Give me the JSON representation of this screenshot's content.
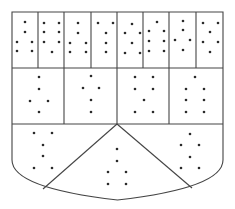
{
  "diagram": {
    "type": "shield-partition",
    "stroke_color": "#444444",
    "dot_color": "#2a2a2a",
    "background": "#ffffff",
    "outline": {
      "left": 12,
      "top": 12,
      "right": 223,
      "side_bottom": 160,
      "curve_bottom": 200
    },
    "row_dividers_y": [
      68,
      124
    ],
    "top_row_column_x": [
      38,
      64,
      91,
      117,
      143,
      169,
      196
    ],
    "middle_row_column_x": [
      64,
      117,
      169
    ],
    "bottom_apex": [
      117,
      124
    ],
    "bottom_diagonals": [
      [
        117,
        124,
        43,
        189
      ],
      [
        117,
        124,
        192,
        188
      ]
    ],
    "sections": [
      {
        "name": "top-1",
        "dots": [
          [
            25,
            22
          ],
          [
            25,
            32
          ],
          [
            17,
            42
          ],
          [
            32,
            42
          ],
          [
            17,
            51
          ],
          [
            32,
            51
          ]
        ]
      },
      {
        "name": "top-2",
        "dots": [
          [
            44,
            23
          ],
          [
            59,
            23
          ],
          [
            44,
            32
          ],
          [
            59,
            32
          ],
          [
            44,
            42
          ],
          [
            59,
            42
          ],
          [
            52,
            52
          ]
        ]
      },
      {
        "name": "top-3",
        "dots": [
          [
            78,
            23
          ],
          [
            78,
            33
          ],
          [
            70,
            43
          ],
          [
            86,
            43
          ],
          [
            70,
            52
          ],
          [
            86,
            52
          ]
        ]
      },
      {
        "name": "top-4",
        "dots": [
          [
            98,
            23
          ],
          [
            113,
            23
          ],
          [
            106,
            33
          ],
          [
            106,
            43
          ],
          [
            106,
            52
          ]
        ]
      },
      {
        "name": "top-5",
        "dots": [
          [
            132,
            24
          ],
          [
            125,
            33
          ],
          [
            140,
            33
          ],
          [
            132,
            43
          ],
          [
            125,
            53
          ],
          [
            140,
            53
          ]
        ]
      },
      {
        "name": "top-6",
        "dots": [
          [
            157,
            22
          ],
          [
            149,
            31
          ],
          [
            164,
            31
          ],
          [
            149,
            41
          ],
          [
            164,
            41
          ],
          [
            149,
            51
          ],
          [
            164,
            51
          ]
        ]
      },
      {
        "name": "top-7",
        "dots": [
          [
            183,
            21
          ],
          [
            175,
            40
          ],
          [
            190,
            40
          ],
          [
            183,
            30
          ],
          [
            183,
            50
          ]
        ]
      },
      {
        "name": "top-8",
        "dots": [
          [
            203,
            23
          ],
          [
            218,
            23
          ],
          [
            210,
            32
          ],
          [
            203,
            42
          ],
          [
            218,
            42
          ],
          [
            210,
            52
          ]
        ]
      },
      {
        "name": "middle-1",
        "dots": [
          [
            39,
            77
          ],
          [
            39,
            89
          ],
          [
            30,
            101
          ],
          [
            48,
            101
          ],
          [
            39,
            112
          ]
        ]
      },
      {
        "name": "middle-2",
        "dots": [
          [
            91,
            76
          ],
          [
            83,
            88
          ],
          [
            99,
            88
          ],
          [
            91,
            100
          ],
          [
            91,
            112
          ]
        ]
      },
      {
        "name": "middle-3",
        "dots": [
          [
            135,
            77
          ],
          [
            153,
            77
          ],
          [
            135,
            89
          ],
          [
            153,
            89
          ],
          [
            144,
            100
          ],
          [
            135,
            112
          ],
          [
            153,
            112
          ]
        ]
      },
      {
        "name": "middle-4",
        "dots": [
          [
            195,
            77
          ],
          [
            186,
            89
          ],
          [
            204,
            89
          ],
          [
            186,
            100
          ],
          [
            204,
            100
          ],
          [
            186,
            112
          ],
          [
            204,
            112
          ]
        ]
      },
      {
        "name": "bottom-left",
        "dots": [
          [
            34,
            133
          ],
          [
            52,
            133
          ],
          [
            43,
            145
          ],
          [
            43,
            156
          ],
          [
            34,
            168
          ],
          [
            52,
            168
          ]
        ]
      },
      {
        "name": "bottom-center",
        "dots": [
          [
            117,
            149
          ],
          [
            117,
            161
          ],
          [
            108,
            172
          ],
          [
            126,
            172
          ],
          [
            108,
            184
          ],
          [
            126,
            184
          ]
        ]
      },
      {
        "name": "bottom-right",
        "dots": [
          [
            190,
            134
          ],
          [
            181,
            145
          ],
          [
            199,
            145
          ],
          [
            190,
            157
          ],
          [
            181,
            168
          ],
          [
            199,
            168
          ]
        ]
      }
    ]
  }
}
